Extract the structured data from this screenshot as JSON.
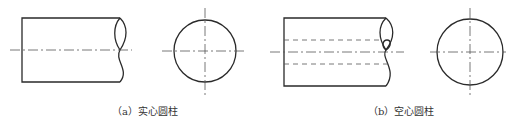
{
  "figures": [
    {
      "id": "a",
      "caption": "（a）实心圆柱",
      "type": "solid-cylinder",
      "hidden_bore": false
    },
    {
      "id": "b",
      "caption": "（b）空心圆柱",
      "type": "hollow-cylinder",
      "hidden_bore": true
    }
  ],
  "colors": {
    "outline": "#2a2a2a",
    "centerline": "#555555",
    "hidden_line": "#555555",
    "background": "#ffffff"
  }
}
